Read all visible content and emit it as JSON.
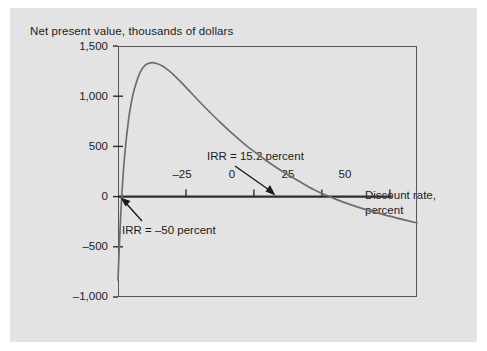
{
  "figure": {
    "background_color": "#e3e3e3",
    "page_color": "#ffffff",
    "frame_color": "#555557",
    "curve_color": "#6e6e70",
    "text_color": "#1c1c1c"
  },
  "chart_data": {
    "type": "line",
    "title": "Net present value, thousands of dollars",
    "ylabel": "Net present value, thousands of dollars",
    "xlabel": "Discount rate, percent",
    "xlabel_line1": "Discount rate,",
    "xlabel_line2": "percent",
    "grid": false,
    "legend": "none",
    "xlim": [
      -50,
      60
    ],
    "ylim": [
      -1000,
      1500
    ],
    "xticks": [
      -25,
      0,
      25,
      50
    ],
    "xtick_labels": [
      "–25",
      "0",
      "25",
      "50"
    ],
    "yticks": [
      -1000,
      -500,
      0,
      500,
      1000,
      1500
    ],
    "ytick_labels": [
      "–1,000",
      "–500",
      "0",
      "500",
      "1,000",
      "1,500"
    ],
    "series": [
      {
        "name": "NPV profile",
        "x": [
          -50,
          -49,
          -48,
          -47,
          -46,
          -45,
          -44,
          -42,
          -40,
          -38,
          -37,
          -36,
          -34,
          -32,
          -30,
          -27,
          -24,
          -20,
          -16,
          -12,
          -8,
          -4,
          0,
          4,
          8,
          12,
          15.2,
          18,
          22,
          26,
          30,
          35,
          40,
          45,
          50,
          55,
          60
        ],
        "y": [
          -830,
          -180,
          260,
          560,
          790,
          950,
          1070,
          1230,
          1310,
          1332,
          1333,
          1328,
          1305,
          1270,
          1225,
          1145,
          1060,
          945,
          835,
          730,
          630,
          535,
          450,
          370,
          295,
          225,
          175,
          130,
          70,
          20,
          -25,
          -75,
          -120,
          -160,
          -195,
          -230,
          -262
        ],
        "annotations": [
          {
            "label": "IRR = 15.2 percent",
            "value": 15.2,
            "unit": "percent",
            "points_to": [
              15.2,
              0
            ]
          },
          {
            "label": "IRR = –50 percent",
            "value": -50,
            "unit": "percent",
            "points_to": [
              -50,
              0
            ]
          }
        ],
        "zero_crossings": [
          -50,
          15.2
        ],
        "peak": {
          "x": -37,
          "y": 1333
        }
      }
    ]
  },
  "annotations": {
    "irr_positive": "IRR = 15.2 percent",
    "irr_negative": "IRR = –50 percent"
  }
}
